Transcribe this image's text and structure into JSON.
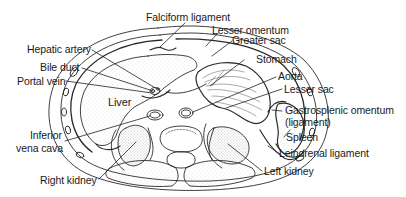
{
  "diagram": {
    "type": "anatomical cross-section",
    "organ_labels": {
      "liver": "Liver"
    },
    "labels": {
      "falciform_ligament": "Falciform ligament",
      "lesser_omentum": "Lesser omentum",
      "greater_sac": "Greater sac",
      "stomach": "Stomach",
      "aorta": "Aorta",
      "lesser_sac": "Lesser sac",
      "gastrosplenic_line1": "Gastrosplenic omentum",
      "gastrosplenic_line2": "(ligament)",
      "spleen": "Spleen",
      "leinorenal_ligament": "Leinorenal ligament",
      "left_kidney": "Left kidney",
      "right_kidney": "Right kidney",
      "ivc_line1": "Inferior",
      "ivc_line2": "vena cava",
      "hepatic_artery": "Hepatic artery",
      "bile_duct": "Bile duct",
      "portal_vein": "Portal vein"
    },
    "colors": {
      "line": "#2a2a2a",
      "stipple": "#9a9a9a",
      "background": "#ffffff"
    }
  }
}
